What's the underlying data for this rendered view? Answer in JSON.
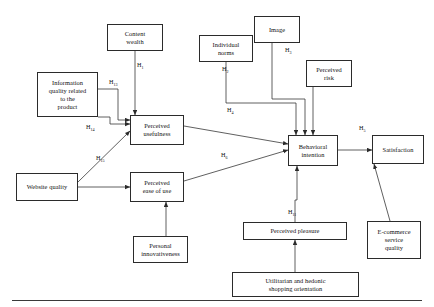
{
  "figure": {
    "type": "research-model-path-diagram",
    "stroke_color": "#2b2b2b",
    "background_color": "#ffffff"
  },
  "nodes": [
    {
      "id": "content_wealth",
      "label": "Content\nwealth"
    },
    {
      "id": "information_quality",
      "label": "Information\nquality related\nto the\nproduct"
    },
    {
      "id": "website_quality",
      "label": "Website quality"
    },
    {
      "id": "perceived_usefulness",
      "label": "Perceived\nusefulness"
    },
    {
      "id": "perceived_ease_of_use",
      "label": "Perceived\nease of use"
    },
    {
      "id": "personal_innovativeness",
      "label": "Personal\ninnovativeness"
    },
    {
      "id": "individual_norms",
      "label": "Individual\nnorms"
    },
    {
      "id": "image",
      "label": "Image"
    },
    {
      "id": "perceived_risk",
      "label": "Perceived\nrisk"
    },
    {
      "id": "behavioral_intention",
      "label": "Behavioral\nintention"
    },
    {
      "id": "satisfaction",
      "label": "Satisfaction"
    },
    {
      "id": "perceived_pleasure",
      "label": "Perceived pleasure"
    },
    {
      "id": "utilitarian_hedonic",
      "label": "Utilitarian and hedonic\nshopping orientation"
    },
    {
      "id": "ecommerce_service",
      "label": "E-commerce\nservice\nquality"
    }
  ],
  "hypotheses": [
    {
      "id": "h1",
      "base": "H",
      "sub": "1",
      "from": "content_wealth",
      "to": "perceived_usefulness"
    },
    {
      "id": "h2",
      "base": "H",
      "sub": "2",
      "from": "individual_norms",
      "to": "behavioral_intention"
    },
    {
      "id": "h3",
      "base": "H",
      "sub": "3",
      "from": "image",
      "to": "behavioral_intention"
    },
    {
      "id": "h4",
      "base": "H",
      "sub": "4",
      "from": "perceived_usefulness",
      "to": "behavioral_intention"
    },
    {
      "id": "h5",
      "base": "H",
      "sub": "5",
      "from": "behavioral_intention",
      "to": "satisfaction"
    },
    {
      "id": "h6",
      "base": "H",
      "sub": "6",
      "from": "perceived_ease_of_use",
      "to": "behavioral_intention"
    },
    {
      "id": "h11",
      "base": "H",
      "sub": "11",
      "from": "perceived_pleasure",
      "to": "behavioral_intention"
    },
    {
      "id": "h13",
      "base": "H",
      "sub": "13",
      "from": "information_quality",
      "to": "perceived_usefulness"
    },
    {
      "id": "h14",
      "base": "H",
      "sub": "14",
      "from": "information_quality",
      "to": "perceived_usefulness"
    },
    {
      "id": "h15",
      "base": "H",
      "sub": "15",
      "from": "website_quality",
      "to": "perceived_usefulness"
    }
  ],
  "unlabeled_edges": [
    {
      "from": "website_quality",
      "to": "perceived_ease_of_use"
    },
    {
      "from": "personal_innovativeness",
      "to": "perceived_ease_of_use"
    },
    {
      "from": "perceived_risk",
      "to": "behavioral_intention"
    },
    {
      "from": "utilitarian_hedonic",
      "to": "perceived_pleasure"
    },
    {
      "from": "ecommerce_service",
      "to": "satisfaction"
    }
  ]
}
